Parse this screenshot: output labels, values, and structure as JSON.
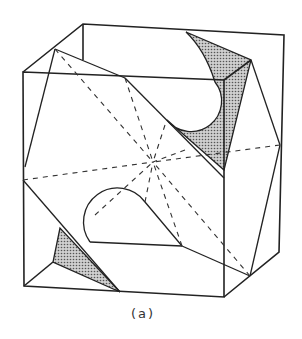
{
  "figure": {
    "caption": "(a)"
  },
  "colors": {
    "stroke": "#222222",
    "shade": "#9a9a9a",
    "background": "#ffffff"
  }
}
